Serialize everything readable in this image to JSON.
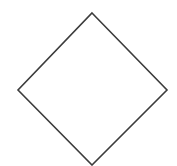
{
  "canvas": {
    "width": 177,
    "height": 166,
    "background_color": "#ffffff",
    "title": "Diamond"
  },
  "figure": {
    "name": "diamond",
    "type": "polygon",
    "sides": 4,
    "stroke_color": "#3c3c3c",
    "stroke_width": 1.6,
    "fill": "none",
    "vertices": [
      {
        "label": "top",
        "x": 92,
        "y": 13
      },
      {
        "label": "right",
        "x": 167,
        "y": 90
      },
      {
        "label": "bottom",
        "x": 92,
        "y": 165
      },
      {
        "label": "left",
        "x": 18,
        "y": 90
      }
    ],
    "points_attr": "92,13 167,90 92,165 18,90",
    "width_px": 149,
    "height_px": 152,
    "center": {
      "x": 92.5,
      "y": 89
    }
  }
}
